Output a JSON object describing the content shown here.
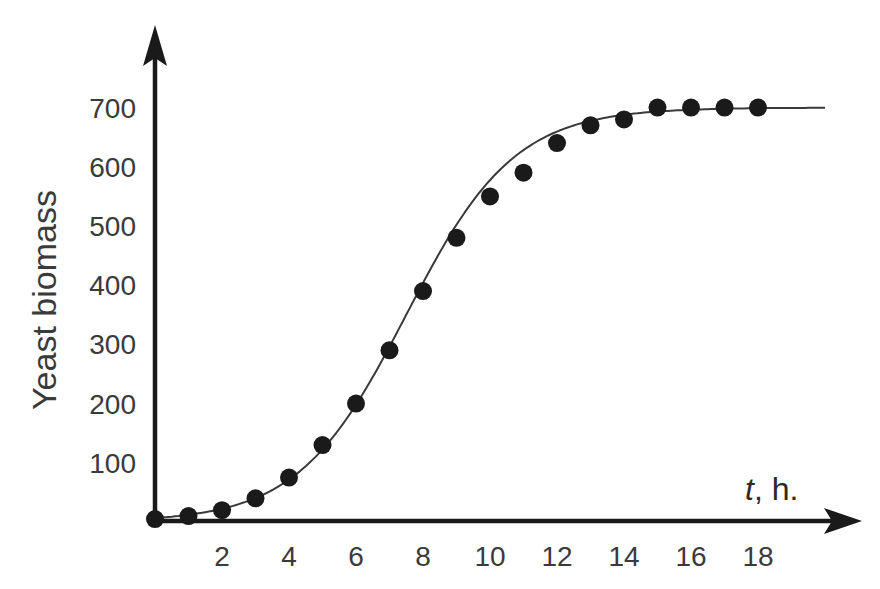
{
  "chart_data": {
    "type": "scatter",
    "title": "",
    "xlabel": "t, h.",
    "xlabel_var": "t",
    "xlabel_unit": ", h.",
    "ylabel": "Yeast biomass",
    "x_ticks": [
      2,
      4,
      6,
      8,
      10,
      12,
      14,
      16,
      18
    ],
    "y_ticks": [
      100,
      200,
      300,
      400,
      500,
      600,
      700
    ],
    "xlim": [
      0,
      20
    ],
    "ylim": [
      0,
      750
    ],
    "grid": false,
    "legend": null,
    "series": [
      {
        "name": "Measured biomass",
        "kind": "points",
        "x": [
          0,
          1,
          2,
          3,
          4,
          5,
          6,
          7,
          8,
          9,
          10,
          11,
          12,
          13,
          14,
          15,
          16,
          17,
          18
        ],
        "y": [
          5,
          10,
          20,
          40,
          75,
          130,
          200,
          290,
          390,
          480,
          550,
          590,
          640,
          670,
          680,
          700,
          700,
          700,
          700
        ]
      },
      {
        "name": "Logistic fit",
        "kind": "line",
        "model": "logistic",
        "K": 700,
        "r": 0.62,
        "t_mid": 7.5,
        "x_range": [
          0,
          20
        ]
      }
    ],
    "colors": {
      "axis": "#1a1a1a",
      "points": "#1a1a1a",
      "curve": "#3a3a3a",
      "text": "#3a3a3a"
    }
  }
}
